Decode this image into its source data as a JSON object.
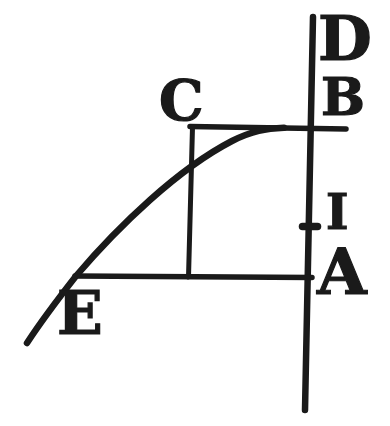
{
  "figure": {
    "type": "geometric-diagram",
    "labels": {
      "D": "D",
      "B": "B",
      "C": "C",
      "I": "I",
      "A": "A",
      "E": "E"
    }
  },
  "colors": {
    "ink": "#1a1a1a",
    "paper": "#ffffff"
  }
}
